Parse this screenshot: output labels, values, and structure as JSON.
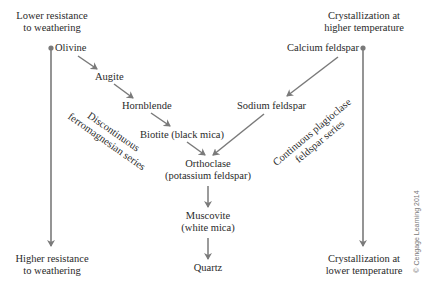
{
  "diagram": {
    "left_axis": {
      "top_label": [
        "Lower resistance",
        "to weathering"
      ],
      "bottom_label": [
        "Higher resistance",
        "to weathering"
      ]
    },
    "right_axis": {
      "top_label": [
        "Crystallization at",
        "higher temperature"
      ],
      "bottom_label": [
        "Crystallization at",
        "lower temperature"
      ]
    },
    "discontinuous_series": {
      "label": [
        "Discontinuous",
        "ferromagnesian series"
      ],
      "minerals": [
        "Olivine",
        "Augite",
        "Hornblende",
        "Biotite (black mica)"
      ]
    },
    "continuous_series": {
      "label": [
        "Continuous plagioclase",
        "feldspar series"
      ],
      "minerals": [
        "Calcium feldspar",
        "Sodium feldspar"
      ]
    },
    "converged_series": {
      "minerals": [
        [
          "Orthoclase",
          "(potassium feldspar)"
        ],
        [
          "Muscovite",
          "(white mica)"
        ],
        [
          "Quartz"
        ]
      ]
    },
    "colors": {
      "line": "#7a7a7a",
      "text": "#2a2a2a"
    },
    "copyright": "© Cengage Learning 2014"
  }
}
